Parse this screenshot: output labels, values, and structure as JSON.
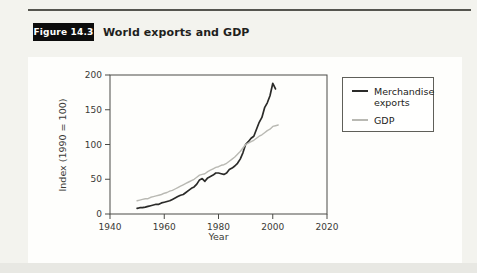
{
  "figure": {
    "label": "Figure 14.3",
    "title": "World exports and GDP"
  },
  "colors": {
    "page_background": "#f3f3ee",
    "panel_background": "#fefefc",
    "rule": "#55554f",
    "badge_background": "#0c0c0c",
    "badge_text": "#fdfdfb",
    "axis": "#4a4a46",
    "exports_line": "#2b2b29",
    "gdp_line": "#b9b9b3"
  },
  "chart_data": {
    "type": "line",
    "title": "World exports and GDP",
    "xlabel": "Year",
    "ylabel": "Index (1990 = 100)",
    "xlim": [
      1940,
      2020
    ],
    "ylim": [
      0,
      200
    ],
    "x_ticks": [
      1940,
      1960,
      1980,
      2000,
      2020
    ],
    "y_ticks": [
      0,
      50,
      100,
      150,
      200
    ],
    "grid": false,
    "frame": true,
    "axis_color": "#4a4a46",
    "legend": {
      "position": "upper-right-outside",
      "entries": [
        {
          "label": "Merchandise exports",
          "color": "#2b2b29"
        },
        {
          "label": "GDP",
          "color": "#b9b9b3"
        }
      ]
    },
    "series": [
      {
        "name": "Merchandise exports",
        "color": "#2b2b29",
        "width": 1.7,
        "points": [
          [
            1950,
            8
          ],
          [
            1951,
            9
          ],
          [
            1952,
            9
          ],
          [
            1953,
            10
          ],
          [
            1954,
            11
          ],
          [
            1955,
            12
          ],
          [
            1956,
            13
          ],
          [
            1957,
            14
          ],
          [
            1958,
            14
          ],
          [
            1959,
            16
          ],
          [
            1960,
            17
          ],
          [
            1961,
            18
          ],
          [
            1962,
            19
          ],
          [
            1963,
            21
          ],
          [
            1964,
            23
          ],
          [
            1965,
            25
          ],
          [
            1966,
            27
          ],
          [
            1967,
            28
          ],
          [
            1968,
            31
          ],
          [
            1969,
            34
          ],
          [
            1970,
            37
          ],
          [
            1971,
            39
          ],
          [
            1972,
            43
          ],
          [
            1973,
            49
          ],
          [
            1974,
            51
          ],
          [
            1975,
            47
          ],
          [
            1976,
            52
          ],
          [
            1977,
            54
          ],
          [
            1978,
            56
          ],
          [
            1979,
            59
          ],
          [
            1980,
            59
          ],
          [
            1981,
            58
          ],
          [
            1982,
            57
          ],
          [
            1983,
            59
          ],
          [
            1984,
            64
          ],
          [
            1985,
            66
          ],
          [
            1986,
            69
          ],
          [
            1987,
            73
          ],
          [
            1988,
            79
          ],
          [
            1989,
            88
          ],
          [
            1990,
            100
          ],
          [
            1991,
            104
          ],
          [
            1992,
            109
          ],
          [
            1993,
            112
          ],
          [
            1994,
            122
          ],
          [
            1995,
            132
          ],
          [
            1996,
            139
          ],
          [
            1997,
            153
          ],
          [
            1998,
            160
          ],
          [
            1999,
            170
          ],
          [
            2000,
            188
          ],
          [
            2001,
            180
          ]
        ]
      },
      {
        "name": "GDP",
        "color": "#b9b9b3",
        "width": 1.4,
        "points": [
          [
            1950,
            19
          ],
          [
            1951,
            20
          ],
          [
            1952,
            21
          ],
          [
            1953,
            22
          ],
          [
            1954,
            22
          ],
          [
            1955,
            24
          ],
          [
            1956,
            25
          ],
          [
            1957,
            26
          ],
          [
            1958,
            27
          ],
          [
            1959,
            28
          ],
          [
            1960,
            30
          ],
          [
            1961,
            31
          ],
          [
            1962,
            33
          ],
          [
            1963,
            34
          ],
          [
            1964,
            36
          ],
          [
            1965,
            38
          ],
          [
            1966,
            40
          ],
          [
            1967,
            42
          ],
          [
            1968,
            44
          ],
          [
            1969,
            46
          ],
          [
            1970,
            48
          ],
          [
            1971,
            50
          ],
          [
            1972,
            53
          ],
          [
            1973,
            56
          ],
          [
            1974,
            57
          ],
          [
            1975,
            58
          ],
          [
            1976,
            61
          ],
          [
            1977,
            63
          ],
          [
            1978,
            65
          ],
          [
            1979,
            67
          ],
          [
            1980,
            68
          ],
          [
            1981,
            70
          ],
          [
            1982,
            71
          ],
          [
            1983,
            73
          ],
          [
            1984,
            76
          ],
          [
            1985,
            79
          ],
          [
            1986,
            82
          ],
          [
            1987,
            86
          ],
          [
            1988,
            90
          ],
          [
            1989,
            95
          ],
          [
            1990,
            100
          ],
          [
            1991,
            102
          ],
          [
            1992,
            104
          ],
          [
            1993,
            106
          ],
          [
            1994,
            109
          ],
          [
            1995,
            112
          ],
          [
            1996,
            114
          ],
          [
            1997,
            117
          ],
          [
            1998,
            120
          ],
          [
            1999,
            122
          ],
          [
            2000,
            126
          ],
          [
            2001,
            127
          ],
          [
            2002,
            128
          ]
        ]
      }
    ]
  }
}
